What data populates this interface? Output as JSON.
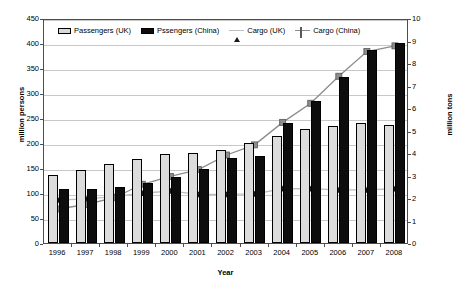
{
  "chart_data": {
    "type": "bar",
    "title": "",
    "xlabel": "Year",
    "ylabel": "million persons",
    "ylabel_secondary": "million tons",
    "categories": [
      "1996",
      "1997",
      "1998",
      "1999",
      "2000",
      "2001",
      "2002",
      "2003",
      "2004",
      "2005",
      "2006",
      "2007",
      "2008"
    ],
    "ylim": [
      0,
      450
    ],
    "ylim_secondary": [
      0,
      10
    ],
    "yticks": [
      0,
      50,
      100,
      150,
      200,
      250,
      300,
      350,
      400,
      450
    ],
    "yticks_secondary": [
      0,
      1,
      2,
      3,
      4,
      5,
      6,
      7,
      8,
      9,
      10
    ],
    "grid": true,
    "legend_position": "top-inside",
    "series": [
      {
        "name": "Passengers (UK)",
        "type": "bar",
        "axis": "left",
        "color": "#dcdcdc",
        "values": [
          136,
          146,
          158,
          168,
          179,
          181,
          187,
          200,
          215,
          228,
          235,
          240,
          236
        ]
      },
      {
        "name": "Pssengers (China)",
        "type": "bar",
        "axis": "left",
        "color": "#0d0d0d",
        "values": [
          108,
          109,
          113,
          120,
          133,
          148,
          171,
          174,
          241,
          284,
          332,
          386,
          400
        ]
      },
      {
        "name": "Cargo (UK)",
        "type": "line",
        "axis": "right",
        "color": "#c0c0c0",
        "marker": "triangle",
        "marker_color": "#1a1a1a",
        "values": [
          2.0,
          2.05,
          2.15,
          2.3,
          2.4,
          2.25,
          2.25,
          2.27,
          2.5,
          2.5,
          2.45,
          2.45,
          2.5
        ]
      },
      {
        "name": "Cargo (China)",
        "type": "line",
        "axis": "right",
        "color": "#8c8c8c",
        "marker": "square",
        "marker_color": "#8c8c8c",
        "values": [
          1.6,
          1.8,
          2.1,
          2.7,
          3.05,
          3.35,
          4.0,
          4.45,
          5.45,
          6.3,
          7.5,
          8.6,
          8.85
        ]
      }
    ]
  },
  "legend": {
    "items": [
      {
        "label": "Passengers (UK)",
        "icon": "legend-swatch-bar-light"
      },
      {
        "label": "Pssengers (China)",
        "icon": "legend-swatch-bar-dark"
      },
      {
        "label": "Cargo (UK)",
        "icon": "legend-line-triangle"
      },
      {
        "label": "Cargo (China)",
        "icon": "legend-line-square"
      }
    ]
  },
  "colors": {
    "bar_uk": "#dcdcdc",
    "bar_china": "#0d0d0d",
    "line_uk": "#c0c0c0",
    "line_china": "#8c8c8c",
    "grid": "#c8c8c8",
    "frame": "#4d4d4d"
  }
}
